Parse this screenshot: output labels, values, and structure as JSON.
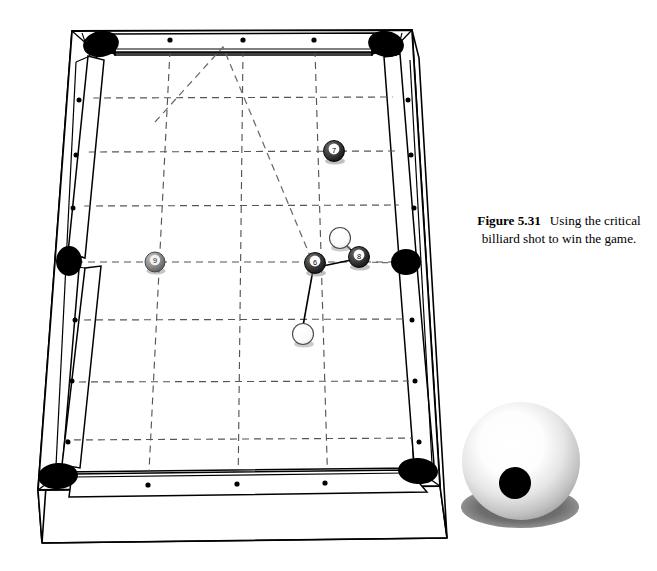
{
  "figure": {
    "caption_label": "Figure 5.31",
    "caption_text": "Using the critical billiard shot to win the game.",
    "caption_line1": "Using the",
    "caption_line2": "critical billiard shot to",
    "caption_line3": "win the game."
  },
  "colors": {
    "line": "#000000",
    "rail_fill": "#ffffff",
    "cloth_fill": "#ffffff",
    "pocket": "#000000",
    "grid_dash": "#555555",
    "trajectory_dash": "#6b6b6b",
    "ball_dark": "#3a3a3a",
    "ball_light": "#ffffff",
    "ball_gray": "#8a8a8a",
    "shadow": "#666666",
    "sphere_highlight": "#ffffff",
    "sphere_edge": "#9a9a9a",
    "sphere_dot": "#000000"
  },
  "table": {
    "name": "billiard-table",
    "pockets": [
      {
        "id": "pocket-top-left",
        "cx": 101,
        "cy": 44,
        "rx": 18,
        "ry": 13,
        "angle": -8
      },
      {
        "id": "pocket-top-right",
        "cx": 386,
        "cy": 44,
        "rx": 18,
        "ry": 13,
        "angle": 8
      },
      {
        "id": "pocket-side-left",
        "cx": 69,
        "cy": 261,
        "rx": 13,
        "ry": 15,
        "angle": 0
      },
      {
        "id": "pocket-side-right",
        "cx": 406,
        "cy": 262,
        "rx": 15,
        "ry": 13,
        "angle": 0
      },
      {
        "id": "pocket-bottom-left",
        "cx": 58,
        "cy": 476,
        "rx": 20,
        "ry": 13,
        "angle": 0
      },
      {
        "id": "pocket-bottom-right",
        "cx": 418,
        "cy": 471,
        "rx": 20,
        "ry": 13,
        "angle": 0
      }
    ],
    "diamonds_top": [
      {
        "cx": 170,
        "cy": 37
      },
      {
        "cx": 243,
        "cy": 37
      },
      {
        "cx": 314,
        "cy": 37
      }
    ],
    "diamonds_bottom": [
      {
        "cx": 148,
        "cy": 489
      },
      {
        "cx": 237,
        "cy": 489
      },
      {
        "cx": 325,
        "cy": 489
      }
    ],
    "diamonds_left": [
      {
        "cx": 78,
        "cy": 100
      },
      {
        "cx": 74,
        "cy": 154
      },
      {
        "cx": 71,
        "cy": 207
      },
      {
        "cx": 64,
        "cy": 320
      },
      {
        "cx": 61,
        "cy": 381
      },
      {
        "cx": 57,
        "cy": 442
      }
    ],
    "diamonds_right": [
      {
        "cx": 409,
        "cy": 100
      },
      {
        "cx": 412,
        "cy": 154
      },
      {
        "cx": 415,
        "cy": 207
      },
      {
        "cx": 419,
        "cy": 320
      },
      {
        "cx": 422,
        "cy": 381
      },
      {
        "cx": 426,
        "cy": 442
      }
    ]
  },
  "grid": {
    "horizontal_count": 6,
    "vertical_count": 3,
    "style": "dashed-perspective"
  },
  "balls": [
    {
      "id": "ball-7",
      "label": "7",
      "cx": 334,
      "cy": 151,
      "r": 10.5,
      "kind": "dark"
    },
    {
      "id": "ball-9",
      "label": "9",
      "cx": 155,
      "cy": 262,
      "r": 10.0,
      "kind": "gray"
    },
    {
      "id": "ball-6",
      "label": "6",
      "cx": 315,
      "cy": 263,
      "r": 10.5,
      "kind": "dark"
    },
    {
      "id": "ball-8",
      "label": "8",
      "cx": 359,
      "cy": 257,
      "r": 10.5,
      "kind": "dark"
    },
    {
      "id": "cue-ball-upper",
      "label": "",
      "cx": 340,
      "cy": 238,
      "r": 10.5,
      "kind": "white"
    },
    {
      "id": "cue-ball-lower",
      "label": "",
      "cx": 303,
      "cy": 334,
      "r": 10.5,
      "kind": "white"
    }
  ],
  "shot_lines": [
    {
      "id": "contact-line-6-8",
      "x1": 318,
      "y1": 267,
      "x2": 356,
      "y2": 259
    },
    {
      "id": "contact-line-cue-8",
      "x1": 344,
      "y1": 242,
      "x2": 356,
      "y2": 255
    },
    {
      "id": "contact-line-6-cue",
      "x1": 314,
      "y1": 268,
      "x2": 303,
      "y2": 330
    }
  ],
  "trajectory": {
    "id": "bank-shot-path",
    "description": "dashed bank shot path off the top rail",
    "points": [
      {
        "x": 155,
        "y": 122
      },
      {
        "x": 223,
        "y": 47
      },
      {
        "x": 313,
        "y": 263
      }
    ]
  },
  "aim_line_right": {
    "id": "aim-line-to-side-pocket",
    "x1": 362,
    "y1": 262,
    "x2": 400,
    "y2": 263
  },
  "cue_sphere": {
    "id": "cue-ball-closeup",
    "cx": 521,
    "cy": 461,
    "r": 59,
    "dot_cx": 515,
    "dot_cy": 483,
    "dot_r": 16,
    "shadow_cx": 520,
    "shadow_cy": 512,
    "shadow_rx": 59,
    "shadow_ry": 22
  }
}
